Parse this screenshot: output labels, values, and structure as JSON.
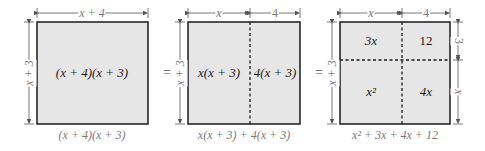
{
  "figure": {
    "panels": [
      {
        "id": "panel-1",
        "top_dim": "x + 4",
        "left_dim": "x + 3",
        "regions": [
          {
            "label": "(x + 4)(x + 3)"
          }
        ],
        "caption": "(x + 4)(x + 3)"
      },
      {
        "id": "panel-2",
        "top_dims": [
          "x",
          "4"
        ],
        "left_dim": "x + 3",
        "regions": [
          {
            "label": "x(x + 3)"
          },
          {
            "label": "4(x + 3)"
          }
        ],
        "caption": "x(x + 3) + 4(x + 3)"
      },
      {
        "id": "panel-3",
        "top_dims": [
          "x",
          "4"
        ],
        "left_dim": "x + 3",
        "right_dims": [
          "3",
          "x"
        ],
        "regions": [
          {
            "label": "3x"
          },
          {
            "label": "12"
          },
          {
            "label": "x²"
          },
          {
            "label": "4x"
          }
        ],
        "caption": "x² + 3x + 4x + 12"
      }
    ],
    "equals": [
      "=",
      "="
    ],
    "colors": {
      "fill": "#e6e6e6",
      "border": "#1a1a1a",
      "dim_line": "#666666"
    }
  }
}
